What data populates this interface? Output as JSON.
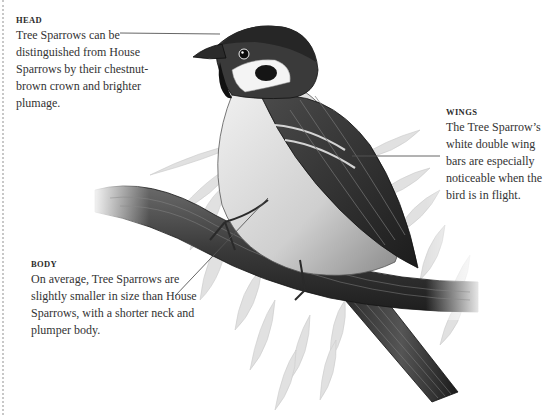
{
  "figure": {
    "callouts": [
      {
        "id": "head",
        "title": "HEAD",
        "text": "Tree Sparrows can be distinguished from House Sparrows by their chestnut-brown crown and brighter plumage."
      },
      {
        "id": "wings",
        "title": "WINGS",
        "text": "The Tree Sparrow’s white double wing bars are especially noticeable when the bird is in flight."
      },
      {
        "id": "body",
        "title": "BODY",
        "text": "On average, Tree Sparrows are slightly smaller in size than House Sparrows, with a shorter neck and plumper body."
      }
    ],
    "colors": {
      "ink_dark": "#1a1a1a",
      "ink_mid": "#5a5a5a",
      "leaf": "#d4d4d4",
      "leader_line": "#555555",
      "text": "#333333"
    }
  }
}
